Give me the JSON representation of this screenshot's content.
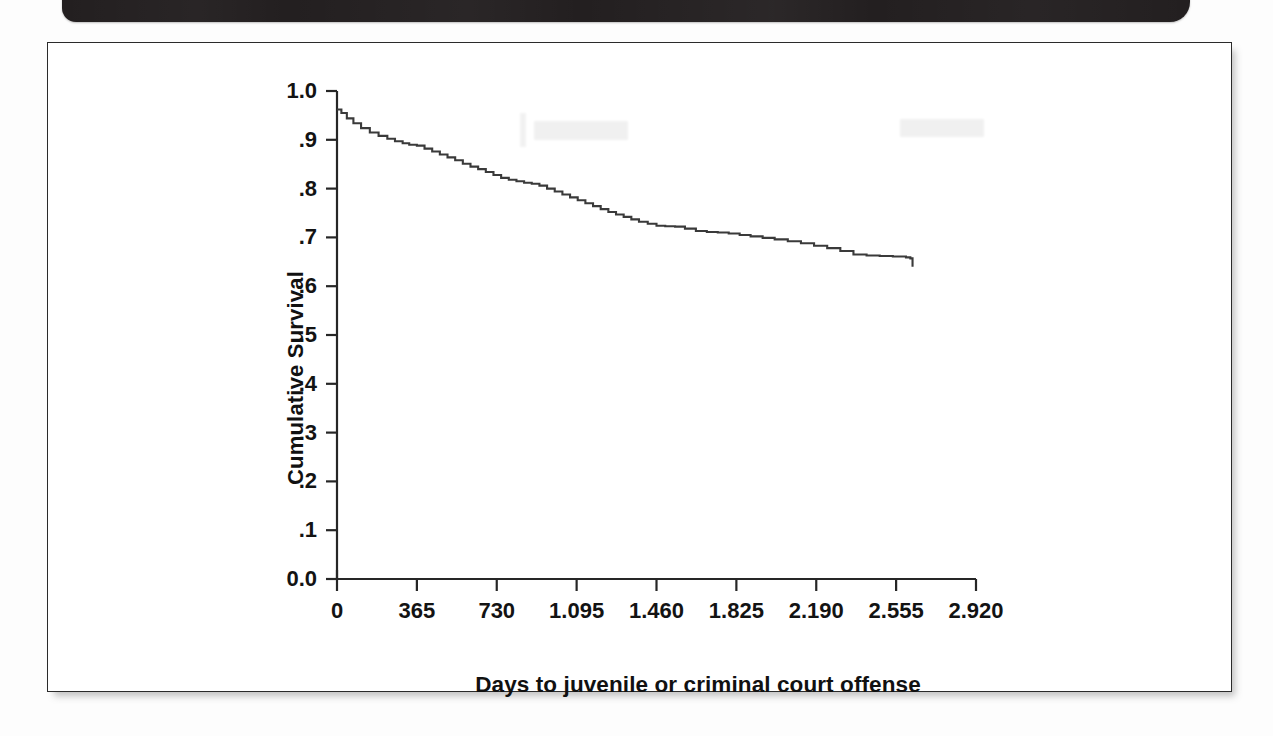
{
  "page": {
    "background_color": "#fdfdfd",
    "band_color": "#231f20",
    "frame_color": "#2b2b2b"
  },
  "chart_data": {
    "type": "line",
    "title": "",
    "subtitle": "",
    "xlabel": "Days to juvenile or criminal court offense",
    "ylabel": "Cumulative Survival",
    "xlim": [
      0,
      2920
    ],
    "ylim": [
      0.0,
      1.0
    ],
    "grid": false,
    "legend": null,
    "line_color": "#3a3a3a",
    "x_tick_labels": [
      "0",
      "365",
      "730",
      "1.095",
      "1.460",
      "1.825",
      "2.190",
      "2.555",
      "2.920"
    ],
    "x_tick_values": [
      0,
      365,
      730,
      1095,
      1460,
      1825,
      2190,
      2555,
      2920
    ],
    "y_tick_labels": [
      "0.0",
      ".1",
      ".2",
      ".3",
      ".4",
      ".5",
      ".6",
      ".7",
      ".8",
      ".9",
      "1.0"
    ],
    "y_tick_values": [
      0.0,
      0.1,
      0.2,
      0.3,
      0.4,
      0.5,
      0.6,
      0.7,
      0.8,
      0.9,
      1.0
    ],
    "series": [
      {
        "name": "Cumulative survival",
        "step": "post",
        "x": [
          0,
          20,
          45,
          75,
          110,
          150,
          190,
          230,
          265,
          300,
          330,
          365,
          400,
          435,
          470,
          505,
          540,
          575,
          610,
          645,
          680,
          715,
          750,
          785,
          820,
          855,
          890,
          925,
          960,
          995,
          1030,
          1065,
          1100,
          1135,
          1170,
          1205,
          1240,
          1275,
          1310,
          1345,
          1380,
          1420,
          1460,
          1500,
          1545,
          1590,
          1640,
          1690,
          1740,
          1790,
          1840,
          1890,
          1945,
          2000,
          2060,
          2120,
          2180,
          2240,
          2300,
          2360,
          2420,
          2480,
          2540,
          2600,
          2620,
          2630
        ],
        "y": [
          0.962,
          0.955,
          0.944,
          0.934,
          0.924,
          0.915,
          0.908,
          0.902,
          0.897,
          0.893,
          0.89,
          0.888,
          0.882,
          0.876,
          0.87,
          0.864,
          0.858,
          0.851,
          0.845,
          0.84,
          0.834,
          0.828,
          0.822,
          0.818,
          0.815,
          0.812,
          0.81,
          0.806,
          0.8,
          0.794,
          0.788,
          0.782,
          0.776,
          0.77,
          0.764,
          0.758,
          0.752,
          0.747,
          0.742,
          0.737,
          0.732,
          0.728,
          0.724,
          0.723,
          0.722,
          0.718,
          0.713,
          0.711,
          0.71,
          0.708,
          0.705,
          0.702,
          0.699,
          0.696,
          0.692,
          0.688,
          0.683,
          0.678,
          0.672,
          0.665,
          0.663,
          0.662,
          0.661,
          0.659,
          0.657,
          0.64
        ]
      }
    ]
  }
}
